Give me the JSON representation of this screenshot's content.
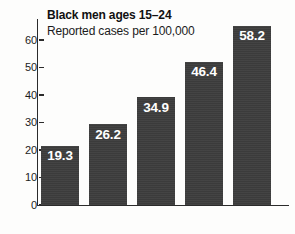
{
  "chart_data": {
    "type": "bar",
    "title": "Black men ages 15–24",
    "subtitle": "Reported cases per 100,000",
    "xlabel": "",
    "ylabel": "",
    "categories": [
      "2005",
      "2006",
      "2007",
      "2008",
      "2009"
    ],
    "values": [
      19.3,
      26.2,
      34.9,
      46.4,
      58.2
    ],
    "value_labels": [
      "19.3",
      "26.2",
      "34.9",
      "46.4",
      "58.2"
    ],
    "ylim": [
      0,
      60
    ],
    "y_ticks": [
      0,
      10,
      20,
      30,
      40,
      50,
      60
    ],
    "y_tick_labels": [
      "0",
      "10",
      "20",
      "30",
      "40",
      "50",
      "60"
    ],
    "grid": false,
    "legend": false,
    "legend_position": "none",
    "bar_color": "#3d3d3d",
    "value_label_color": "#ffffff",
    "axis_color": "#2b2b2b",
    "background_color": "#fdfdfc"
  }
}
